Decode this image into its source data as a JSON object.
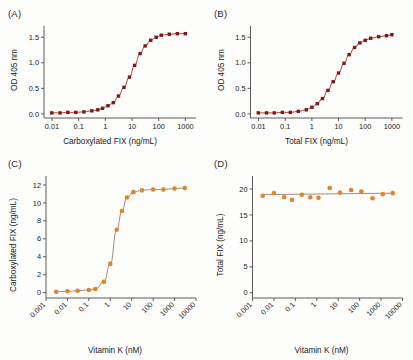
{
  "figure": {
    "background": "#fdfdfc",
    "panels": [
      {
        "label": "(A)",
        "marker_color": "#7B1B1B",
        "line_color": "#B03A2E"
      },
      {
        "label": "(B)",
        "marker_color": "#7B1B1B",
        "line_color": "#B03A2E"
      },
      {
        "label": "(C)",
        "marker_color": "#E08427",
        "line_color": "#9a8f84"
      },
      {
        "label": "(D)",
        "marker_color": "#E08427",
        "line_color": "#9a8f84"
      }
    ]
  },
  "chart_data": [
    {
      "type": "line",
      "panel": "A",
      "title": "(A)",
      "xlabel": "Carboxylated FIX (ng/mL)",
      "ylabel": "OD 405 nm",
      "xscale": "log",
      "xlim": [
        0.005,
        2500
      ],
      "ylim": [
        -0.08,
        1.72
      ],
      "xticks": [
        0.01,
        0.1,
        1,
        10,
        100,
        1000
      ],
      "xtick_labels": [
        "0.01",
        "0.1",
        "1",
        "10",
        "100",
        "1000"
      ],
      "yticks": [
        0.0,
        0.5,
        1.0,
        1.5
      ],
      "ytick_labels": [
        "0.0",
        "0.5",
        "1.0",
        "1.5"
      ],
      "grid": false,
      "legend": "none",
      "series": [
        {
          "name": "Carboxylated FIX standard curve",
          "x": [
            0.0098,
            0.02,
            0.039,
            0.078,
            0.156,
            0.31,
            0.52,
            0.78,
            1.25,
            2.0,
            3.1,
            5.0,
            8.0,
            12.5,
            20,
            31,
            50,
            80,
            125,
            250,
            500,
            1000
          ],
          "y": [
            0.02,
            0.02,
            0.03,
            0.03,
            0.04,
            0.06,
            0.08,
            0.11,
            0.16,
            0.22,
            0.35,
            0.52,
            0.72,
            0.95,
            1.18,
            1.33,
            1.44,
            1.5,
            1.54,
            1.56,
            1.57,
            1.57
          ]
        }
      ]
    },
    {
      "type": "line",
      "panel": "B",
      "title": "(B)",
      "xlabel": "Total FIX (ng/mL)",
      "ylabel": "OD 405 nm",
      "xscale": "log",
      "xlim": [
        0.005,
        2500
      ],
      "ylim": [
        -0.08,
        1.72
      ],
      "xticks": [
        0.01,
        0.1,
        1,
        10,
        100,
        1000
      ],
      "xtick_labels": [
        "0.01",
        "0.1",
        "1",
        "10",
        "100",
        "1000"
      ],
      "yticks": [
        0.0,
        0.5,
        1.0,
        1.5
      ],
      "ytick_labels": [
        "0.0",
        "0.5",
        "1.0",
        "1.5"
      ],
      "grid": false,
      "legend": "none",
      "series": [
        {
          "name": "Total FIX standard curve",
          "x": [
            0.0098,
            0.02,
            0.039,
            0.078,
            0.156,
            0.31,
            0.62,
            1.0,
            1.6,
            2.5,
            4.0,
            6.3,
            10,
            16,
            25,
            40,
            63,
            100,
            160,
            320,
            630,
            1000
          ],
          "y": [
            0.02,
            0.02,
            0.02,
            0.03,
            0.03,
            0.05,
            0.08,
            0.13,
            0.2,
            0.3,
            0.46,
            0.63,
            0.8,
            0.99,
            1.16,
            1.3,
            1.39,
            1.44,
            1.48,
            1.51,
            1.53,
            1.55
          ]
        }
      ]
    },
    {
      "type": "line",
      "panel": "C",
      "title": "(C)",
      "xlabel": "Vitamin K (nM)",
      "ylabel": "Carboxylated FIX (ng/mL)",
      "xscale": "log",
      "xlim": [
        0.001,
        10000
      ],
      "ylim": [
        -0.6,
        13
      ],
      "xticks": [
        0.001,
        0.01,
        0.1,
        1,
        10,
        100,
        1000,
        10000
      ],
      "xtick_labels": [
        "0.001",
        "0.01",
        "0.1",
        "1",
        "10",
        "100",
        "1000",
        "10000"
      ],
      "yticks": [
        0,
        2,
        4,
        6,
        8,
        10,
        12
      ],
      "ytick_labels": [
        "0",
        "2",
        "4",
        "6",
        "8",
        "10",
        "12"
      ],
      "grid": false,
      "legend": "none",
      "series": [
        {
          "name": "Carboxylated FIX vs Vitamin K",
          "x": [
            0.003,
            0.01,
            0.03,
            0.1,
            0.2,
            0.5,
            1.0,
            2.0,
            3.5,
            6.0,
            12,
            30,
            100,
            300,
            1000,
            3000
          ],
          "y": [
            0.1,
            0.15,
            0.2,
            0.3,
            0.4,
            1.2,
            3.2,
            7.0,
            9.1,
            10.6,
            11.2,
            11.4,
            11.5,
            11.5,
            11.6,
            11.65
          ]
        }
      ]
    },
    {
      "type": "scatter",
      "panel": "D",
      "title": "(D)",
      "xlabel": "Vitamin K (nM)",
      "ylabel": "Total FIX (ng/mL)",
      "xscale": "log",
      "xlim": [
        0.001,
        10000
      ],
      "ylim": [
        -1,
        22.5
      ],
      "xticks": [
        0.001,
        0.01,
        0.1,
        1,
        10,
        100,
        1000,
        10000
      ],
      "xtick_labels": [
        "0.001",
        "0.01",
        "0.1",
        "1",
        "10",
        "100",
        "1000",
        "10000"
      ],
      "yticks": [
        0,
        5,
        10,
        15,
        20
      ],
      "ytick_labels": [
        "0",
        "5",
        "10",
        "15",
        "20"
      ],
      "grid": false,
      "legend": "none",
      "series": [
        {
          "name": "Total FIX vs Vitamin K",
          "x": [
            0.003,
            0.01,
            0.03,
            0.07,
            0.2,
            0.5,
            1.2,
            4.0,
            12,
            40,
            120,
            400,
            1200,
            3500
          ],
          "y": [
            18.7,
            19.2,
            18.4,
            17.9,
            18.9,
            18.4,
            18.3,
            20.2,
            19.3,
            19.8,
            19.5,
            18.2,
            19.0,
            19.2
          ]
        }
      ],
      "fit_line": {
        "name": "horizontal fit",
        "x": [
          0.0025,
          4000
        ],
        "y": [
          18.9,
          19.2
        ]
      }
    }
  ]
}
